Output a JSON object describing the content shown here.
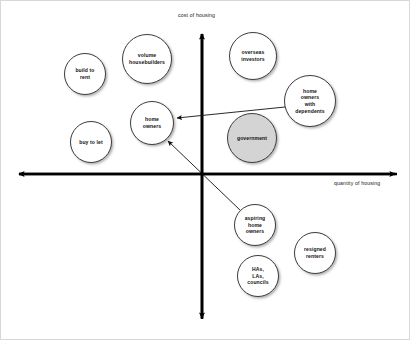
{
  "diagram": {
    "axes": {
      "vertical_label": "cost of housing",
      "horizontal_label": "quantity of housing",
      "vertical_axis_name": "cost-axis",
      "horizontal_axis_name": "quantity-axis",
      "stroke_color": "#000000"
    },
    "colors": {
      "bubble_fill": "#ffffff",
      "bubble_fill_highlighted": "#d4d4d4",
      "bubble_stroke": "#3d3d3d",
      "text": "#111111",
      "canvas": "#ffffff",
      "border": "#d8d8d8"
    },
    "bubbles": [
      {
        "id": "build-to-rent",
        "label": "build to\nrent",
        "quadrant": "top-left",
        "cx": 84,
        "cy": 73,
        "r": 21,
        "filled": false
      },
      {
        "id": "volume-housebuilders",
        "label": "volume\nhousebuilders",
        "quadrant": "top-left",
        "cx": 146,
        "cy": 58,
        "r": 25,
        "filled": false
      },
      {
        "id": "overseas-investors",
        "label": "overseas\ninvestors",
        "quadrant": "top-right",
        "cx": 252,
        "cy": 55,
        "r": 24,
        "filled": false
      },
      {
        "id": "home-owners-with-dependents",
        "label": "home\nowners\nwith\ndependents",
        "quadrant": "top-right",
        "cx": 309,
        "cy": 100,
        "r": 26,
        "filled": false
      },
      {
        "id": "home-owners",
        "label": "home\nowners",
        "quadrant": "top-left",
        "cx": 151,
        "cy": 122,
        "r": 22,
        "filled": false
      },
      {
        "id": "government",
        "label": "government",
        "quadrant": "top-right",
        "cx": 251,
        "cy": 137,
        "r": 25,
        "filled": true
      },
      {
        "id": "buy-to-let",
        "label": "buy to let",
        "quadrant": "top-left",
        "cx": 90,
        "cy": 141,
        "r": 21,
        "filled": false
      },
      {
        "id": "aspiring-home-owners",
        "label": "aspiring\nhome\nowners",
        "quadrant": "bottom-right",
        "cx": 254,
        "cy": 224,
        "r": 21,
        "filled": false
      },
      {
        "id": "resigned-renters",
        "label": "resigned\nrenters",
        "quadrant": "bottom-right",
        "cx": 314,
        "cy": 252,
        "r": 21,
        "filled": false
      },
      {
        "id": "has-las-councils",
        "label": "HAs,\nLAs,\ncouncils",
        "quadrant": "bottom-right",
        "cx": 257,
        "cy": 275,
        "r": 21,
        "filled": false
      }
    ],
    "arrows": [
      {
        "id": "dependents-to-home-owners",
        "from": "home-owners-with-dependents",
        "to": "home-owners",
        "x1": 284,
        "y1": 106,
        "x2": 175,
        "y2": 117
      },
      {
        "id": "aspiring-to-home-owners",
        "from": "aspiring-home-owners",
        "to": "home-owners",
        "x1": 240,
        "y1": 210,
        "x2": 166,
        "y2": 139
      }
    ]
  }
}
